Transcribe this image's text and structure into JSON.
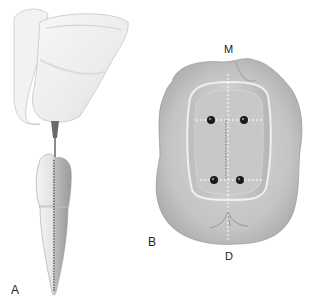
{
  "figure": {
    "panel_labels": {
      "a": "A",
      "b": "B"
    },
    "orientation_labels": {
      "mesial": "M",
      "distal": "D"
    },
    "panel_a": {
      "subject": "hand-held endodontic file inserted along root canal of single-rooted tooth"
    },
    "panel_b": {
      "subject": "occlusal view of molar access cavity with four canal orifices and dashed reference lines",
      "orifice_count": 4
    },
    "colors": {
      "background": "#ffffff",
      "tooth_light": "#e6e6e6",
      "tooth_mid": "#bdbdbd",
      "tooth_dark": "#8a8a8a",
      "orifice": "#1a1a1a",
      "guide_line": "#ffffff"
    }
  }
}
